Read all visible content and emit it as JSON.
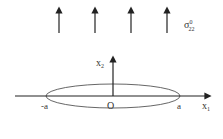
{
  "diagram": {
    "stress_label": {
      "base": "σ",
      "superscript": "0",
      "subscript": "22"
    },
    "applied_stress_arrows": 4,
    "axes": {
      "horizontal": "x",
      "horizontal_sub": "1",
      "vertical": "x",
      "vertical_sub": "2"
    },
    "points": {
      "left": "-a",
      "origin": "O",
      "right": "a"
    },
    "colors": {
      "line": "#222222",
      "ellipse": "#555555",
      "text": "#333333"
    }
  }
}
